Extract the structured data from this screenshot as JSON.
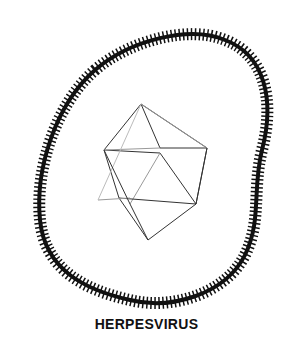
{
  "diagram": {
    "title": "HERPESVIRUS",
    "parts": [
      {
        "name": "envelope",
        "description": "irregular lipid envelope with spike projections"
      },
      {
        "name": "capsid",
        "description": "icosahedral capsid"
      }
    ],
    "colors": {
      "line": "#111111",
      "background": "#ffffff"
    }
  }
}
